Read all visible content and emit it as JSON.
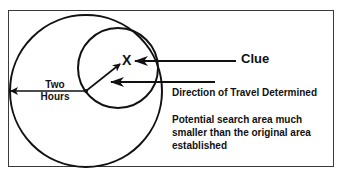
{
  "diagram": {
    "labels": {
      "clue": "Clue",
      "two_hours": "Two Hours",
      "direction": "Direction of Travel Determined",
      "potential": "Potential search area much smaller than the original area established",
      "x_marker": "X"
    },
    "colors": {
      "stroke": "#111111",
      "frame": "#3a3a3a",
      "background": "#ffffff"
    },
    "shapes": {
      "large_circle": {
        "cx": 86,
        "cy": 91,
        "r": 76
      },
      "small_circle": {
        "cx": 118,
        "cy": 68,
        "r": 40
      }
    }
  }
}
